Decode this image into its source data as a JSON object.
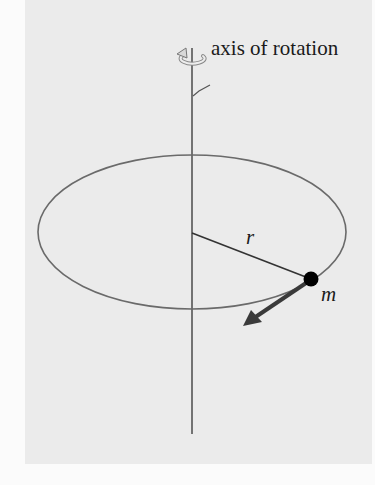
{
  "figure": {
    "labels": {
      "axis": "axis of rotation",
      "radius": "r",
      "mass": "m"
    },
    "icons": {
      "rotation": "rotation-arrow-icon"
    },
    "colors": {
      "panel_background": "#ebebeb",
      "page_background": "#fbfbfb",
      "line": "#555555",
      "mass_dot": "#000000",
      "velocity_arrow": "#3a3a3a"
    },
    "geometry": {
      "axis_x": 192,
      "orbit_center": [
        192,
        232
      ],
      "orbit_rx": 154,
      "orbit_ry": 77,
      "mass_position": [
        311,
        279
      ],
      "velocity_arrow_tip": [
        243,
        326
      ]
    }
  }
}
